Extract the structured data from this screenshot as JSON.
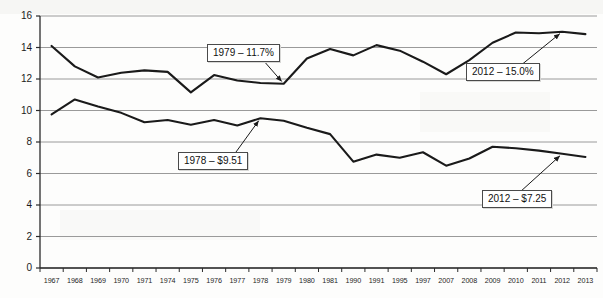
{
  "chart_data": {
    "type": "line",
    "title": "",
    "subtitle": "",
    "xlabel": "",
    "ylabel": "",
    "ylim": [
      0,
      16
    ],
    "ytick_step": 2,
    "yticks": [
      "0",
      "2",
      "4",
      "6",
      "8",
      "10",
      "12",
      "14",
      "16"
    ],
    "grid": true,
    "grid_axis": "y",
    "legend": "none",
    "categories": [
      "1967",
      "1968",
      "1969",
      "1970",
      "1971",
      "1974",
      "1975",
      "1976",
      "1977",
      "1978",
      "1979",
      "1980",
      "1981",
      "1990",
      "1991",
      "1995",
      "1997",
      "2007",
      "2008",
      "2009",
      "2010",
      "2011",
      "2012",
      "2013"
    ],
    "series": [
      {
        "name": "Percent",
        "unit": "%",
        "values": [
          14.1,
          12.8,
          12.1,
          12.4,
          12.55,
          12.45,
          11.15,
          12.25,
          11.9,
          11.75,
          11.7,
          13.3,
          13.9,
          13.5,
          14.15,
          13.8,
          13.1,
          12.3,
          13.2,
          14.3,
          14.95,
          14.9,
          15.0,
          14.85
        ]
      },
      {
        "name": "Dollars",
        "unit": "$",
        "values": [
          9.75,
          10.7,
          10.25,
          9.85,
          9.25,
          9.4,
          9.1,
          9.4,
          9.05,
          9.51,
          9.35,
          8.9,
          8.5,
          6.75,
          7.2,
          7.0,
          7.35,
          6.5,
          6.95,
          7.7,
          7.6,
          7.45,
          7.25,
          7.05
        ]
      }
    ],
    "annotations": [
      {
        "id": "ann-1979-pct",
        "text": "1979 – 11.7%",
        "series": "Percent",
        "category": "1979"
      },
      {
        "id": "ann-2012-pct",
        "text": "2012 – 15.0%",
        "series": "Percent",
        "category": "2012"
      },
      {
        "id": "ann-1978-dollar",
        "text": "1978 – $9.51",
        "series": "Dollars",
        "category": "1978"
      },
      {
        "id": "ann-2012-dollar",
        "text": "2012 – $7.25",
        "series": "Dollars",
        "category": "2012"
      }
    ],
    "colors": {
      "series_line": "#1a1a1a",
      "gridline": "#9a9a9a",
      "axis": "#2b2b2b",
      "background": "#fdfdfc",
      "callout_border": "#4a4a4a",
      "text": "#111111"
    }
  }
}
